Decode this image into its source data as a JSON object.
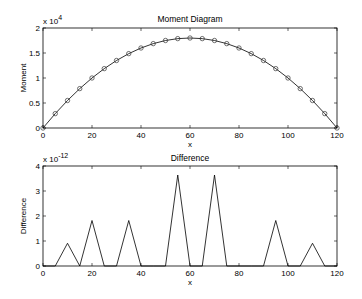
{
  "chart_data": [
    {
      "type": "line",
      "title": "Moment Diagram",
      "xlabel": "x",
      "ylabel": "Moment",
      "y_multiplier": "x 10",
      "y_exponent": "4",
      "xlim": [
        0,
        120
      ],
      "ylim": [
        0,
        2
      ],
      "xticks": [
        "0",
        "20",
        "40",
        "60",
        "80",
        "100",
        "120"
      ],
      "yticks": [
        "0",
        "0.5",
        "1",
        "1.5",
        "2"
      ],
      "grid": false,
      "series": [
        {
          "name": "Moment (line)",
          "style": "solid line",
          "x": [
            0,
            5,
            10,
            15,
            20,
            25,
            30,
            35,
            40,
            45,
            50,
            55,
            60,
            65,
            70,
            75,
            80,
            85,
            90,
            95,
            100,
            105,
            110,
            115,
            120
          ],
          "values": [
            0,
            0.2875,
            0.55,
            0.7875,
            1.0,
            1.1875,
            1.35,
            1.4875,
            1.6,
            1.6875,
            1.75,
            1.7875,
            1.8,
            1.7875,
            1.75,
            1.6875,
            1.6,
            1.4875,
            1.35,
            1.1875,
            1.0,
            0.7875,
            0.55,
            0.2875,
            0
          ]
        },
        {
          "name": "Moment (markers)",
          "style": "circle markers",
          "x": [
            0,
            5,
            10,
            15,
            20,
            25,
            30,
            35,
            40,
            45,
            50,
            55,
            60,
            65,
            70,
            75,
            80,
            85,
            90,
            95,
            100,
            105,
            110,
            115,
            120
          ],
          "values": [
            0,
            0.2875,
            0.55,
            0.7875,
            1.0,
            1.1875,
            1.35,
            1.4875,
            1.6,
            1.6875,
            1.75,
            1.7875,
            1.8,
            1.7875,
            1.75,
            1.6875,
            1.6,
            1.4875,
            1.35,
            1.1875,
            1.0,
            0.7875,
            0.55,
            0.2875,
            0
          ]
        }
      ]
    },
    {
      "type": "line",
      "title": "Difference",
      "xlabel": "x",
      "ylabel": "Difference",
      "y_multiplier": "x 10",
      "y_exponent": "-12",
      "xlim": [
        0,
        120
      ],
      "ylim": [
        0,
        4
      ],
      "xticks": [
        "0",
        "20",
        "40",
        "60",
        "80",
        "100",
        "120"
      ],
      "yticks": [
        "0",
        "1",
        "2",
        "3",
        "4"
      ],
      "grid": false,
      "series": [
        {
          "name": "Difference",
          "x": [
            0,
            5,
            10,
            15,
            20,
            25,
            30,
            35,
            40,
            45,
            50,
            55,
            60,
            65,
            70,
            75,
            80,
            85,
            90,
            95,
            100,
            105,
            110,
            115,
            120
          ],
          "values": [
            0,
            0,
            0.91,
            0,
            1.82,
            0,
            0,
            1.82,
            0,
            0,
            0,
            3.64,
            0,
            0,
            3.64,
            0,
            0,
            0,
            0,
            1.82,
            0,
            0,
            0.91,
            0,
            0
          ]
        }
      ]
    }
  ]
}
